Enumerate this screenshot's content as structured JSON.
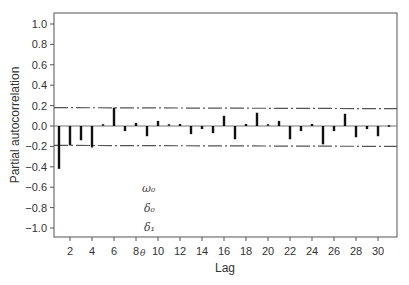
{
  "chart_data": {
    "type": "bar",
    "title": "",
    "xlabel": "Lag",
    "ylabel": "Partial autocorrelation",
    "ylim": [
      -1.1,
      1.1
    ],
    "xlim": [
      0,
      32
    ],
    "yticks": [
      "1.0",
      "0.8",
      "0.6",
      "0.4",
      "0.2",
      "0.0",
      "−0.2",
      "−0.4",
      "−0.6",
      "−0.8",
      "−1.0"
    ],
    "ytick_values": [
      1.0,
      0.8,
      0.6,
      0.4,
      0.2,
      0.0,
      -0.2,
      -0.4,
      -0.6,
      -0.8,
      -1.0
    ],
    "xticks": [
      "2",
      "4",
      "6",
      "8",
      "10",
      "12",
      "14",
      "16",
      "18",
      "20",
      "22",
      "24",
      "26",
      "28",
      "30"
    ],
    "xtick_values": [
      2,
      4,
      6,
      8,
      10,
      12,
      14,
      16,
      18,
      20,
      22,
      24,
      26,
      28,
      30
    ],
    "grid": false,
    "legend": null,
    "categories": [
      1,
      2,
      3,
      4,
      5,
      6,
      7,
      8,
      9,
      10,
      11,
      12,
      13,
      14,
      15,
      16,
      17,
      18,
      19,
      20,
      21,
      22,
      23,
      24,
      25,
      26,
      27,
      28,
      29,
      30,
      31
    ],
    "values": [
      -0.42,
      -0.19,
      -0.14,
      -0.21,
      0.01,
      0.18,
      -0.05,
      0.03,
      -0.1,
      0.05,
      0.01,
      0.02,
      -0.08,
      -0.03,
      -0.07,
      0.1,
      -0.13,
      0.02,
      0.13,
      0.01,
      0.05,
      -0.13,
      -0.05,
      0.02,
      -0.18,
      -0.05,
      0.12,
      -0.11,
      -0.03,
      -0.1,
      -0.01
    ],
    "confidence_band": {
      "upper": [
        0.18,
        0.17
      ],
      "lower": [
        -0.19,
        -0.2
      ],
      "style": "dash-dot"
    },
    "annotations": [
      "ω₀",
      "δ₀",
      "δ₁",
      "θ"
    ]
  },
  "labels": {
    "xlabel": "Lag",
    "ylabel": "Partial autocorrelation",
    "omega0": "ω₀",
    "delta0": "δ₀",
    "delta1": "δ₁",
    "theta": "θ"
  }
}
